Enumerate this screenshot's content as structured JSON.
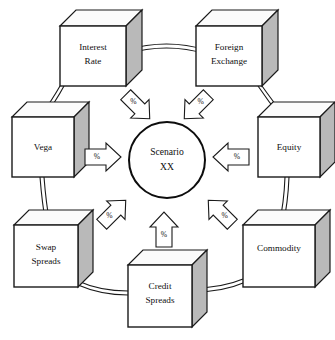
{
  "diagram": {
    "center": {
      "name": "scenario-node",
      "line1": "Scenario",
      "line2": "XX",
      "cx": 167,
      "cy": 160,
      "r": 38
    },
    "colors": {
      "stroke": "#1a1a1a",
      "cube_face": "#ffffff",
      "cube_side": "#b9b9b9",
      "cube_top": "#fbfbfb",
      "background": "#ffffff"
    },
    "nodes": [
      {
        "id": "interest-rate",
        "line1": "Interest",
        "line2": "Rate",
        "x": 60,
        "y": 26,
        "w": 66,
        "h": 60,
        "d": 16
      },
      {
        "id": "foreign-exchange",
        "line1": "Foreign",
        "line2": "Exchange",
        "x": 196,
        "y": 26,
        "w": 66,
        "h": 60,
        "d": 16
      },
      {
        "id": "vega",
        "line1": "Vega",
        "line2": "",
        "x": 12,
        "y": 117,
        "w": 62,
        "h": 60,
        "d": 15
      },
      {
        "id": "equity",
        "line1": "Equity",
        "line2": "",
        "x": 258,
        "y": 117,
        "w": 62,
        "h": 60,
        "d": 15
      },
      {
        "id": "swap-spreads",
        "line1": "Swap",
        "line2": "Spreads",
        "x": 14,
        "y": 225,
        "w": 64,
        "h": 62,
        "d": 15
      },
      {
        "id": "commodity",
        "line1": "Commodity",
        "line2": "",
        "x": 243,
        "y": 225,
        "w": 72,
        "h": 62,
        "d": 15
      },
      {
        "id": "credit-spreads",
        "line1": "Credit",
        "line2": "Spreads",
        "x": 128,
        "y": 265,
        "w": 64,
        "h": 62,
        "d": 15
      }
    ],
    "ring": {
      "name": "connector-ring",
      "cx": 167,
      "cy": 162,
      "r_outer": 121,
      "r_inner": 116
    },
    "arrows": [
      {
        "id": "arrow-interest-rate",
        "label": "%",
        "cx": 137,
        "cy": 106,
        "angle": 135,
        "source": "interest-rate"
      },
      {
        "id": "arrow-foreign-exchange",
        "label": "%",
        "cx": 197,
        "cy": 106,
        "angle": 225,
        "source": "foreign-exchange"
      },
      {
        "id": "arrow-vega",
        "label": "%",
        "cx": 102,
        "cy": 157,
        "angle": 0,
        "source": "vega"
      },
      {
        "id": "arrow-equity",
        "label": "%",
        "cx": 232,
        "cy": 157,
        "angle": 180,
        "source": "equity"
      },
      {
        "id": "arrow-swap-spreads",
        "label": "%",
        "cx": 113,
        "cy": 213,
        "angle": 315,
        "source": "swap-spreads"
      },
      {
        "id": "arrow-commodity",
        "label": "%",
        "cx": 221,
        "cy": 213,
        "angle": 45,
        "source": "commodity"
      },
      {
        "id": "arrow-credit-spreads",
        "label": "%",
        "cx": 164,
        "cy": 231,
        "angle": 270,
        "source": "credit-spreads"
      }
    ]
  }
}
